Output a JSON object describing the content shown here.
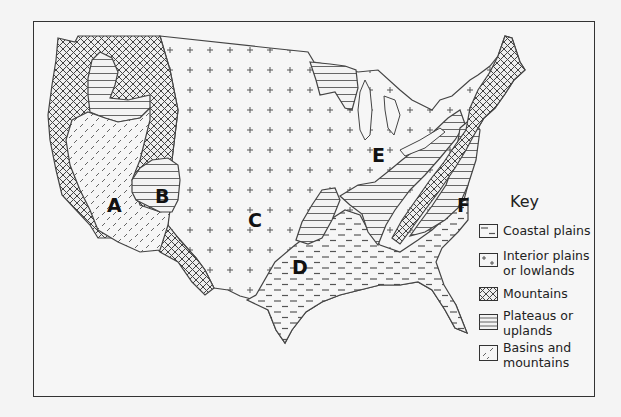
{
  "map": {
    "subject": "Landform regions of the contiguous United States",
    "region_labels": [
      {
        "id": "A",
        "x": 107,
        "y": 196
      },
      {
        "id": "B",
        "x": 155,
        "y": 187
      },
      {
        "id": "C",
        "x": 248,
        "y": 211
      },
      {
        "id": "D",
        "x": 292,
        "y": 258
      },
      {
        "id": "E",
        "x": 372,
        "y": 146
      },
      {
        "id": "F",
        "x": 457,
        "y": 196
      }
    ],
    "colors": {
      "frame": "#333333",
      "outline": "#444444",
      "pattern_ink": "#555555",
      "background": "#f6f6f6",
      "page": "#f4f4f4"
    }
  },
  "key": {
    "title": "Key",
    "items": [
      {
        "pattern": "coastal-plains",
        "label": "Coastal plains"
      },
      {
        "pattern": "interior-plains",
        "label": "Interior plains or lowlands"
      },
      {
        "pattern": "mountains",
        "label": "Mountains"
      },
      {
        "pattern": "plateaus",
        "label": "Plateaus or uplands"
      },
      {
        "pattern": "basins",
        "label": "Basins and mountains"
      }
    ]
  }
}
